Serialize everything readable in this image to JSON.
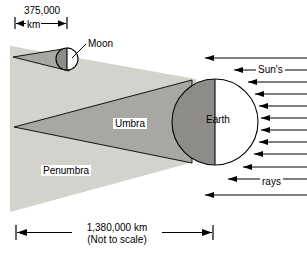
{
  "figure": {
    "type": "diagram",
    "background_color": "#ffffff",
    "ink_color": "#000000",
    "penumbra_fill": "#d4d2cd",
    "umbra_fill": "#a9a7a2",
    "earth_shadow_fill": "#8e8c88",
    "moon_shadow_fill": "#8e8c88"
  },
  "labels": {
    "moon": "Moon",
    "earth": "Earth",
    "umbra": "Umbra",
    "penumbra": "Penumbra",
    "suns": "Sun's",
    "rays": "rays"
  },
  "dimensions": {
    "top": {
      "value": "375,000",
      "unit": "km",
      "description": "Earth-Moon distance annotation with double-headed arrow"
    },
    "bottom": {
      "value": "1,380,000 km",
      "note": "(Not to scale)",
      "description": "Umbra cone length annotation with double-headed arrow"
    }
  },
  "bodies": [
    {
      "name": "Moon",
      "cx": 67,
      "cy": 59,
      "r": 11,
      "lit_side": "right",
      "shaded_side": "left"
    },
    {
      "name": "Earth",
      "cx": 215,
      "cy": 122,
      "r": 43,
      "lit_side": "right",
      "shaded_side": "left"
    }
  ],
  "sun_rays": {
    "direction": "right-to-left",
    "count": 11,
    "arrow_ys": [
      66,
      78,
      90,
      101,
      112,
      122,
      133,
      144,
      155,
      167,
      180
    ]
  }
}
